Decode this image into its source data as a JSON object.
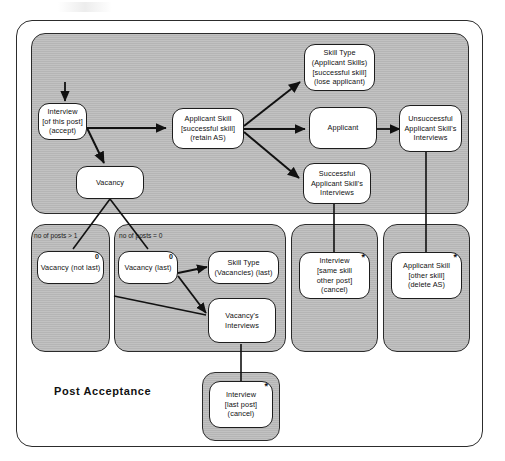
{
  "diagram": {
    "title": "Post  Acceptance",
    "type": "entity-structure-diagram",
    "frame_color": "#2c2c2c",
    "panel_fill": "#bdbdbd",
    "node_fill": "#ffffff"
  },
  "nodes": [
    {
      "id": "interview-this-post",
      "lines": [
        "Interview",
        "[of this post]",
        "(accept)"
      ],
      "marker": ""
    },
    {
      "id": "vacancy",
      "lines": [
        "Vacancy"
      ],
      "marker": ""
    },
    {
      "id": "applicant-skill-successful",
      "lines": [
        "Applicant Skill",
        "[successful skill]",
        "(retain AS)"
      ],
      "marker": ""
    },
    {
      "id": "skill-type-applicant-skills",
      "lines": [
        "Skill Type",
        "(Applicant Skills)",
        "[successful skill]",
        "(lose applicant)"
      ],
      "marker": ""
    },
    {
      "id": "applicant",
      "lines": [
        "Applicant"
      ],
      "marker": ""
    },
    {
      "id": "unsuccessful-applicant-skills-interviews",
      "lines": [
        "Unsuccessful",
        "Applicant Skill's",
        "Interviews"
      ],
      "marker": ""
    },
    {
      "id": "successful-applicant-skills-interviews",
      "lines": [
        "Successful",
        "Applicant Skill's",
        "Interviews"
      ],
      "marker": ""
    },
    {
      "id": "vacancy-not-last",
      "lines": [
        "Vacancy (not last)"
      ],
      "marker": "0"
    },
    {
      "id": "vacancy-last",
      "lines": [
        "Vacancy (last)"
      ],
      "marker": "0"
    },
    {
      "id": "skill-type-vacancies",
      "lines": [
        "Skill Type",
        "(Vacancies) (last)"
      ],
      "marker": ""
    },
    {
      "id": "vacancys-interviews",
      "lines": [
        "Vacancy's",
        "Interviews"
      ],
      "marker": ""
    },
    {
      "id": "interview-same-skill-other-post",
      "lines": [
        "Interview",
        "[same skill",
        "other post]",
        "(cancel)"
      ],
      "marker": "*"
    },
    {
      "id": "applicant-skill-other-skill",
      "lines": [
        "Applicant Skill",
        "[other skill]",
        "(delete AS)"
      ],
      "marker": "*"
    },
    {
      "id": "interview-last-post",
      "lines": [
        "Interview",
        "[last post]",
        "(cancel)"
      ],
      "marker": "*"
    }
  ],
  "conditions": [
    {
      "id": "cond-posts-gt-1",
      "text": "no of posts > 1"
    },
    {
      "id": "cond-posts-eq-0",
      "text": "no of posts = 0"
    }
  ]
}
